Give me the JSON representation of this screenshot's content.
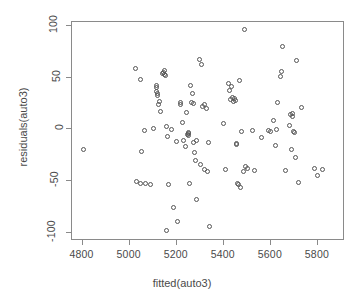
{
  "chart_data": {
    "type": "scatter",
    "title": "",
    "xlabel": "fitted(auto3)",
    "ylabel": "residuals(auto3)",
    "xlim": [
      4755,
      5915
    ],
    "ylim": [
      -108,
      104
    ],
    "xticks": [
      4800,
      5000,
      5200,
      5400,
      5600,
      5800
    ],
    "yticks": [
      100,
      50,
      0,
      -50,
      -100
    ],
    "xtick_labels": [
      "4800",
      "5000",
      "5200",
      "5400",
      "5600",
      "5800"
    ],
    "ytick_labels": [
      "100",
      "50",
      "0",
      "-50",
      "-100"
    ],
    "grid": false,
    "legend": null,
    "marker": "open-circle",
    "marker_color": "#555555",
    "series_name": "residuals",
    "points": [
      [
        4805,
        -19
      ],
      [
        5023,
        59
      ],
      [
        5028,
        -50
      ],
      [
        5047,
        -52
      ],
      [
        5048,
        48
      ],
      [
        5050,
        -21
      ],
      [
        5065,
        -1
      ],
      [
        5068,
        -52
      ],
      [
        5090,
        -53
      ],
      [
        5100,
        1
      ],
      [
        5112,
        41
      ],
      [
        5114,
        37
      ],
      [
        5116,
        43
      ],
      [
        5118,
        33
      ],
      [
        5120,
        35
      ],
      [
        5122,
        24
      ],
      [
        5126,
        27
      ],
      [
        5130,
        17
      ],
      [
        5140,
        54
      ],
      [
        5143,
        55
      ],
      [
        5148,
        53
      ],
      [
        5150,
        57
      ],
      [
        5152,
        52
      ],
      [
        5156,
        3
      ],
      [
        5158,
        -98
      ],
      [
        5162,
        -7
      ],
      [
        5164,
        -53
      ],
      [
        5178,
        0
      ],
      [
        5185,
        -76
      ],
      [
        5200,
        -12
      ],
      [
        5205,
        -89
      ],
      [
        5214,
        26
      ],
      [
        5218,
        24
      ],
      [
        5226,
        7
      ],
      [
        5230,
        -11
      ],
      [
        5236,
        -17
      ],
      [
        5240,
        16
      ],
      [
        5244,
        -5
      ],
      [
        5248,
        -4
      ],
      [
        5250,
        -3
      ],
      [
        5252,
        -6
      ],
      [
        5256,
        -52
      ],
      [
        5260,
        43
      ],
      [
        5262,
        26
      ],
      [
        5266,
        35
      ],
      [
        5270,
        25
      ],
      [
        5272,
        -13
      ],
      [
        5276,
        -22
      ],
      [
        5280,
        -30
      ],
      [
        5282,
        -11
      ],
      [
        5286,
        -68
      ],
      [
        5295,
        68
      ],
      [
        5300,
        -34
      ],
      [
        5305,
        63
      ],
      [
        5310,
        22
      ],
      [
        5316,
        24
      ],
      [
        5320,
        -39
      ],
      [
        5326,
        20
      ],
      [
        5330,
        -41
      ],
      [
        5336,
        -13
      ],
      [
        5340,
        -94
      ],
      [
        5400,
        6
      ],
      [
        5408,
        -39
      ],
      [
        5420,
        44
      ],
      [
        5424,
        38
      ],
      [
        5430,
        29
      ],
      [
        5434,
        42
      ],
      [
        5438,
        31
      ],
      [
        5442,
        27
      ],
      [
        5446,
        30
      ],
      [
        5450,
        28
      ],
      [
        5452,
        -14
      ],
      [
        5456,
        -15
      ],
      [
        5458,
        -52
      ],
      [
        5462,
        -53
      ],
      [
        5466,
        47
      ],
      [
        5470,
        -56
      ],
      [
        5476,
        -2
      ],
      [
        5482,
        -41
      ],
      [
        5488,
        97
      ],
      [
        5494,
        -36
      ],
      [
        5500,
        -38
      ],
      [
        5520,
        -1
      ],
      [
        5530,
        -40
      ],
      [
        5560,
        -8
      ],
      [
        5590,
        -1
      ],
      [
        5600,
        -2
      ],
      [
        5612,
        9
      ],
      [
        5618,
        -16
      ],
      [
        5622,
        0
      ],
      [
        5630,
        26
      ],
      [
        5640,
        51
      ],
      [
        5646,
        56
      ],
      [
        5650,
        80
      ],
      [
        5662,
        -40
      ],
      [
        5678,
        4
      ],
      [
        5682,
        14
      ],
      [
        5686,
        -19
      ],
      [
        5690,
        13
      ],
      [
        5694,
        15
      ],
      [
        5698,
        -2
      ],
      [
        5702,
        -3
      ],
      [
        5706,
        -27
      ],
      [
        5710,
        67
      ],
      [
        5716,
        -51
      ],
      [
        5730,
        21
      ],
      [
        5786,
        -38
      ],
      [
        5800,
        -45
      ],
      [
        5820,
        -39
      ]
    ]
  },
  "axis": {
    "x_title": "fitted(auto3)",
    "y_title": "residuals(auto3)"
  }
}
